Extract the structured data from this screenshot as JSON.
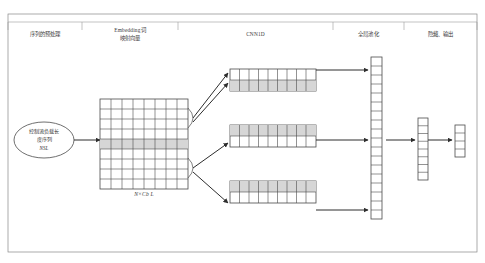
{
  "figure": {
    "background_color": "#ffffff",
    "line_color": "#4a4a4a",
    "shade_color": "#d6d6d6",
    "text_color": "#333333"
  },
  "stage_labels": [
    {
      "id": "input-sequence",
      "text": "序列的预处理"
    },
    {
      "id": "embedding",
      "text": "Embedding词\n映射向量"
    },
    {
      "id": "cnn1d",
      "text": "CNN1D"
    },
    {
      "id": "global-pooling",
      "text": "全局池化"
    },
    {
      "id": "hidden-output",
      "text": "隐藏、输出"
    }
  ],
  "input_node": {
    "label": "控制流负载长\n度序列",
    "sublabel": "NSL"
  },
  "embedding_matrix": {
    "caption": "N×Cb L",
    "columns": 8,
    "rows": 9,
    "highlighted_row_index": 4
  },
  "cnn_blocks": [
    {
      "id": "cnn-block-top",
      "cells": 9,
      "rows": 2,
      "highlighted_row_index": 1
    },
    {
      "id": "cnn-block-middle",
      "cells": 9,
      "rows": 2,
      "highlighted_row_index": 0
    },
    {
      "id": "cnn-block-bottom",
      "cells": 9,
      "rows": 2,
      "highlighted_row_index": 0
    }
  ],
  "pooling_vector": {
    "id": "pooling-vector",
    "cells": 18
  },
  "hidden_vector": {
    "id": "hidden-vector",
    "cells": 8
  },
  "output_vector": {
    "id": "output-vector",
    "cells": 4
  }
}
